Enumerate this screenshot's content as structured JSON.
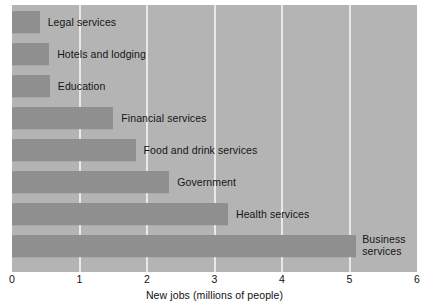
{
  "chart_data": {
    "type": "bar",
    "orientation": "horizontal",
    "title": "",
    "xlabel": "New jobs (millions of people)",
    "ylabel": "",
    "xlim": [
      0,
      6
    ],
    "xticks": [
      0,
      1,
      2,
      3,
      4,
      5,
      6
    ],
    "xtick_labels": [
      "0",
      "1",
      "2",
      "3",
      "4",
      "5",
      "6"
    ],
    "grid": true,
    "grid_axis": "x",
    "legend": false,
    "categories": [
      "Legal services",
      "Hotels and lodging",
      "Education",
      "Financial services",
      "Food and drink services",
      "Government",
      "Health services",
      "Business services"
    ],
    "values": [
      0.41,
      0.55,
      0.56,
      1.5,
      1.83,
      2.33,
      3.2,
      5.1
    ],
    "bars": [
      {
        "label": "Legal services",
        "value": 0.41,
        "label_lines": [
          "Legal services"
        ]
      },
      {
        "label": "Hotels and lodging",
        "value": 0.55,
        "label_lines": [
          "Hotels and lodging"
        ]
      },
      {
        "label": "Education",
        "value": 0.56,
        "label_lines": [
          "Education"
        ]
      },
      {
        "label": "Financial services",
        "value": 1.5,
        "label_lines": [
          "Financial services"
        ]
      },
      {
        "label": "Food and drink services",
        "value": 1.83,
        "label_lines": [
          "Food and drink services"
        ]
      },
      {
        "label": "Government",
        "value": 2.33,
        "label_lines": [
          "Government"
        ]
      },
      {
        "label": "Health services",
        "value": 3.2,
        "label_lines": [
          "Health services"
        ]
      },
      {
        "label": "Business services",
        "value": 5.1,
        "label_lines": [
          "Business",
          "services"
        ]
      }
    ],
    "colors": {
      "plot_background": "#b4b4b4",
      "bar_fill": "#8f8f8f",
      "gridline": "#e9e9e9",
      "text": "#141414",
      "page_background": "#ffffff"
    }
  }
}
